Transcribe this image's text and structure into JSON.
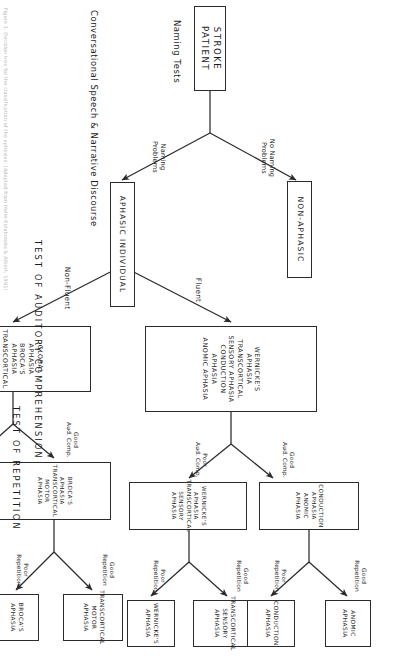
{
  "figure": {
    "type": "flowchart",
    "orientation": "rotated-90-clockwise",
    "caption": "Figure 1.  Decision tree for the classification of the aphasias. (Adapted from Helm-Estabrooks & Albert, 1991)"
  },
  "nodes": {
    "root": {
      "label": "STROKE PATIENT"
    },
    "non_aphasic": {
      "label": "NON-APHASIC"
    },
    "aphasic_individual": {
      "label": "APHASIC INDIVIDUAL"
    },
    "fluent_group": {
      "lines": [
        "WERNICKE'S APHASIA",
        "TRANSCORTICAL SENSORY APHASIA",
        "CONDUCTION APHASIA",
        "ANOMIC APHASIA"
      ]
    },
    "nonfluent_group": {
      "lines": [
        "GLOBAL APHASIA",
        "BROCA'S APHASIA",
        "TRANSCORTICAL MOTOR APHASIA"
      ]
    },
    "fluent_poor_comp": {
      "lines": [
        "WERNICKE'S APHASIA",
        "TRANSCORTICAL SENSORY APHASIA"
      ]
    },
    "fluent_good_comp": {
      "lines": [
        "CONDUCTION APHASIA",
        "ANOMIC APHASIA"
      ]
    },
    "nonfluent_poor_comp": {
      "lines": [
        "GLOBAL APHASIA"
      ]
    },
    "nonfluent_good_comp": {
      "lines": [
        "BROCA'S APHASIA",
        "TRANSCORTICAL MOTOR APHASIA"
      ]
    },
    "leaf_wernickes": {
      "lines": [
        "WERNICKE'S",
        "APHASIA"
      ]
    },
    "leaf_transcortical_sensory": {
      "lines": [
        "TRANSCORTICAL",
        "SENSORY APHASIA"
      ]
    },
    "leaf_conduction": {
      "lines": [
        "CONDUCTION",
        "APHASIA"
      ]
    },
    "leaf_anomic": {
      "lines": [
        "ANOMIC",
        "APHASIA"
      ]
    },
    "leaf_brocas": {
      "lines": [
        "BROCA'S",
        "APHASIA"
      ]
    },
    "leaf_transcortical_motor": {
      "lines": [
        "TRANSCORTICAL",
        "MOTOR APHASIA"
      ]
    }
  },
  "edge_labels": {
    "naming_problems": "Naming\nProblems",
    "no_naming_problems": "No Naming\nProblems",
    "fluent": "Fluent",
    "non_fluent": "Non-Fluent",
    "fluent_poor_comp": "Poor\nAud. Comp.",
    "fluent_good_comp": "Good\nAud. Comp.",
    "nonfluent_poor_comp": "Poor\nAud. Comp.",
    "nonfluent_good_comp": "Good\nAud. Comp.",
    "wernickes_poor_rep": "Poor\nRepetition",
    "transcortical_sensory_good_rep": "Good\nRepetition",
    "conduction_poor_rep": "Poor\nRepetition",
    "anomic_good_rep": "Good\nRepetition",
    "brocas_poor_rep": "Poor\nRepetition",
    "transcortical_motor_good_rep": "Good\nRepetition"
  },
  "stem_labels": {
    "naming_tests": "Naming Tests",
    "conversational_speech": "Conversational Speech & Narrative Discourse"
  },
  "section_labels": {
    "auditory_comprehension": "TEST OF AUDITORY COMPREHENSION",
    "repetition": "TEST OF REPETITION"
  },
  "colors": {
    "ink": "#1d1d1d",
    "stroke": "#2b2b2b",
    "background": "#ffffff",
    "caption": "#b9b9b9"
  }
}
